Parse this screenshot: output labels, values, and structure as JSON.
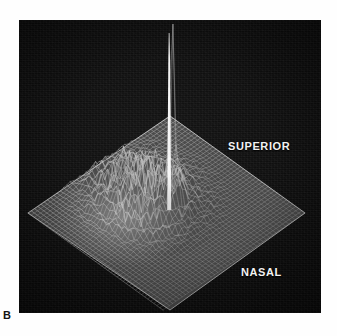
{
  "figure": {
    "panel_letter": "B",
    "background_color": "#fefefe",
    "plate_color": "#0d0d0d",
    "mesh_color": "#b9b9b9",
    "label_color": "#f2f2f2"
  },
  "labels": {
    "superior": "SUPERIOR",
    "nasal": "NASAL"
  },
  "chart_data": {
    "type": "surface",
    "title": "",
    "subtitle": "",
    "xlabel": "",
    "ylabel": "",
    "zlabel": "",
    "annotations": [
      "SUPERIOR",
      "NASAL",
      "B"
    ],
    "legend": [],
    "grid": true,
    "projection": "isometric-wireframe",
    "surface_corners": {
      "top": [
        170,
        116
      ],
      "left": [
        28,
        213
      ],
      "right": [
        305,
        213
      ],
      "bottom": [
        170,
        310
      ]
    },
    "grid_divisions_u": 44,
    "grid_divisions_v": 44,
    "features": [
      {
        "name": "central-spike",
        "kind": "peak",
        "u": 0.5,
        "v": 0.46,
        "height": 1.0,
        "width": 0.012,
        "screen_x": 169,
        "screen_top_y": 33,
        "screen_base_y": 210
      },
      {
        "name": "elevated-mound",
        "kind": "broad-mound",
        "u": 0.34,
        "v": 0.5,
        "height": 0.11,
        "width": 0.34,
        "roughness": 0.55
      },
      {
        "name": "concentric-rings",
        "kind": "contour-rings",
        "u": 0.33,
        "v": 0.52,
        "ring_count": 4,
        "height": 0.05
      }
    ],
    "baseline": 0.0,
    "zlim": [
      0,
      1
    ]
  }
}
